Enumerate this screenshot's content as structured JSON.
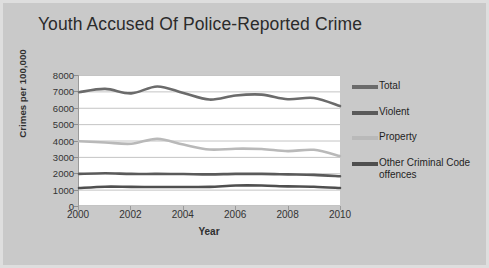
{
  "chart_data": {
    "type": "line",
    "title": "Youth Accused Of Police-Reported Crime",
    "xlabel": "Year",
    "ylabel": "Crimes per 100,000",
    "grid": true,
    "legend_position": "right",
    "xlim": [
      2000,
      2010
    ],
    "ylim": [
      0,
      8000
    ],
    "yticks": [
      "8000",
      "7000",
      "6000",
      "5000",
      "4000",
      "3000",
      "2000",
      "1000",
      "0"
    ],
    "ytick_values": [
      8000,
      7000,
      6000,
      5000,
      4000,
      3000,
      2000,
      1000,
      0
    ],
    "xticks": [
      "2000",
      "2002",
      "2004",
      "2006",
      "2008",
      "2010"
    ],
    "xtick_values": [
      2000,
      2002,
      2004,
      2006,
      2008,
      2010
    ],
    "x": [
      2000,
      2001,
      2002,
      2003,
      2004,
      2005,
      2006,
      2007,
      2008,
      2009,
      2010
    ],
    "series": [
      {
        "name": "Total",
        "color": "#6b6b6b",
        "values": [
          6950,
          7150,
          6880,
          7300,
          6900,
          6500,
          6750,
          6800,
          6520,
          6600,
          6100
        ]
      },
      {
        "name": "Violent",
        "color": "#5a5a5a",
        "values": [
          1960,
          2000,
          1960,
          1960,
          1950,
          1930,
          1960,
          1960,
          1930,
          1900,
          1820
        ]
      },
      {
        "name": "Property",
        "color": "#b9b9b9",
        "values": [
          3950,
          3880,
          3800,
          4100,
          3750,
          3450,
          3500,
          3480,
          3350,
          3430,
          3050
        ]
      },
      {
        "name": "Other Criminal Code offences",
        "color": "#4f4f4f",
        "values": [
          1100,
          1180,
          1170,
          1160,
          1160,
          1170,
          1250,
          1250,
          1200,
          1180,
          1100
        ]
      }
    ]
  }
}
